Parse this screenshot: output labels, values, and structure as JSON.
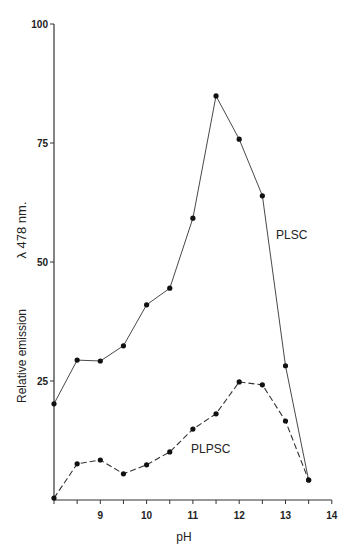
{
  "chart_data": {
    "type": "line",
    "title": "",
    "xlabel": "pH",
    "ylabel": "Relative emission",
    "ylabel_secondary": "λ 478 nm.",
    "xlim": [
      8,
      14
    ],
    "ylim": [
      0,
      100
    ],
    "x_ticks": [
      8,
      8.5,
      9,
      9.5,
      10,
      10.5,
      11,
      11.5,
      12,
      12.5,
      13,
      13.5,
      14
    ],
    "x_tick_labels": [
      "",
      "",
      "9",
      "",
      "10",
      "",
      "11",
      "",
      "12",
      "",
      "13",
      "",
      "14"
    ],
    "y_ticks": [
      25,
      50,
      75,
      100
    ],
    "y_tick_labels": [
      "25",
      "50",
      "75",
      "100"
    ],
    "grid": false,
    "legend": "inline labels",
    "x": [
      8,
      8.5,
      9,
      9.5,
      10,
      10.5,
      11,
      11.5,
      12,
      12.5,
      13,
      13.5
    ],
    "series": [
      {
        "name": "PLSC",
        "style": "solid",
        "x": [
          8,
          8.5,
          9,
          9.5,
          10,
          10.5,
          11,
          11.5,
          12,
          12.5,
          13,
          13.5
        ],
        "values": [
          20.2,
          29.4,
          29.2,
          32.4,
          41.0,
          44.5,
          59.2,
          84.9,
          75.8,
          63.9,
          28.2,
          4.2
        ]
      },
      {
        "name": "PLPSC",
        "style": "dashed",
        "x": [
          8,
          8.5,
          9,
          9.5,
          10,
          10.5,
          11,
          11.5,
          12,
          12.5,
          13,
          13.5
        ],
        "values": [
          0.4,
          7.6,
          8.4,
          5.5,
          7.4,
          10.1,
          14.9,
          18.1,
          24.8,
          24.2,
          16.6,
          4.2
        ]
      }
    ],
    "annotations": [
      {
        "text": "PLSC",
        "x": 13.3,
        "y": 55
      },
      {
        "text": "PLPSC",
        "x": 11.3,
        "y": 12
      }
    ]
  },
  "labels": {
    "xlabel": "pH",
    "ylabel": "Relative emission",
    "ylabel_secondary": "λ 478 nm.",
    "plsc": "PLSC",
    "plpsc": "PLPSC"
  },
  "colors": {
    "line": "#333333",
    "marker": "#111111",
    "axis": "#333333"
  }
}
